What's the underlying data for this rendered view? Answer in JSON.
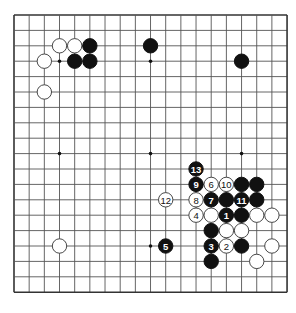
{
  "board": {
    "size": 19,
    "origin_x": 14,
    "origin_y": 15,
    "spacing_x": 15.17,
    "spacing_y": 15.4,
    "stone_radius": 7.2,
    "star_points": [
      [
        3,
        3
      ],
      [
        9,
        3
      ],
      [
        15,
        3
      ],
      [
        3,
        9
      ],
      [
        9,
        9
      ],
      [
        15,
        9
      ],
      [
        3,
        15
      ],
      [
        9,
        15
      ],
      [
        15,
        15
      ]
    ],
    "colors": {
      "background": "#ffffff",
      "line": "#555555",
      "black_stone": "#111111",
      "white_stone": "#ffffff"
    }
  },
  "stones": [
    {
      "color": "white",
      "col": 3,
      "row": 2
    },
    {
      "color": "white",
      "col": 4,
      "row": 2
    },
    {
      "color": "black",
      "col": 5,
      "row": 2
    },
    {
      "color": "white",
      "col": 2,
      "row": 3
    },
    {
      "color": "black",
      "col": 4,
      "row": 3
    },
    {
      "color": "black",
      "col": 5,
      "row": 3
    },
    {
      "color": "white",
      "col": 2,
      "row": 5
    },
    {
      "color": "black",
      "col": 9,
      "row": 2
    },
    {
      "color": "black",
      "col": 15,
      "row": 3
    },
    {
      "color": "black",
      "col": 12,
      "row": 10,
      "label": "13"
    },
    {
      "color": "black",
      "col": 12,
      "row": 11,
      "label": "9"
    },
    {
      "color": "white",
      "col": 13,
      "row": 11,
      "label": "6"
    },
    {
      "color": "white",
      "col": 14,
      "row": 11,
      "label": "10"
    },
    {
      "color": "black",
      "col": 15,
      "row": 11
    },
    {
      "color": "black",
      "col": 16,
      "row": 11
    },
    {
      "color": "white",
      "col": 10,
      "row": 12,
      "label": "12"
    },
    {
      "color": "white",
      "col": 12,
      "row": 12,
      "label": "8"
    },
    {
      "color": "black",
      "col": 13,
      "row": 12,
      "label": "7"
    },
    {
      "color": "black",
      "col": 14,
      "row": 12
    },
    {
      "color": "black",
      "col": 15,
      "row": 12,
      "label": "11"
    },
    {
      "color": "black",
      "col": 16,
      "row": 12
    },
    {
      "color": "white",
      "col": 12,
      "row": 13,
      "label": "4"
    },
    {
      "color": "white",
      "col": 13,
      "row": 13
    },
    {
      "color": "black",
      "col": 14,
      "row": 13,
      "label": "1"
    },
    {
      "color": "black",
      "col": 15,
      "row": 13
    },
    {
      "color": "white",
      "col": 16,
      "row": 13
    },
    {
      "color": "white",
      "col": 17,
      "row": 13
    },
    {
      "color": "black",
      "col": 13,
      "row": 14
    },
    {
      "color": "white",
      "col": 14,
      "row": 14
    },
    {
      "color": "white",
      "col": 15,
      "row": 14
    },
    {
      "color": "white",
      "col": 3,
      "row": 15
    },
    {
      "color": "black",
      "col": 10,
      "row": 15,
      "label": "5"
    },
    {
      "color": "black",
      "col": 13,
      "row": 15,
      "label": "3"
    },
    {
      "color": "white",
      "col": 14,
      "row": 15,
      "label": "2"
    },
    {
      "color": "black",
      "col": 15,
      "row": 15
    },
    {
      "color": "white",
      "col": 17,
      "row": 15
    },
    {
      "color": "black",
      "col": 13,
      "row": 16
    },
    {
      "color": "white",
      "col": 16,
      "row": 16
    }
  ]
}
